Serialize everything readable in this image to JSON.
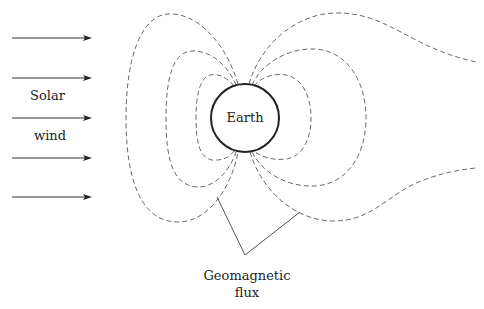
{
  "diagram": {
    "type": "schematic",
    "labels": {
      "solar": "Solar",
      "wind": "wind",
      "earth": "Earth",
      "flux_line1": "Geomagnetic",
      "flux_line2": "flux"
    },
    "colors": {
      "field_lines": "#6a6a6a",
      "arrows": "#222222",
      "earth_outline": "#222222",
      "background": "#ffffff"
    },
    "solar_wind_arrows": [
      {
        "y": 38
      },
      {
        "y": 78
      },
      {
        "y": 118
      },
      {
        "y": 158
      },
      {
        "y": 197
      }
    ],
    "field_line_style": "dashed",
    "annotations": [
      {
        "text": "Geomagnetic flux",
        "points_to": "dashed field lines below Earth"
      }
    ]
  }
}
